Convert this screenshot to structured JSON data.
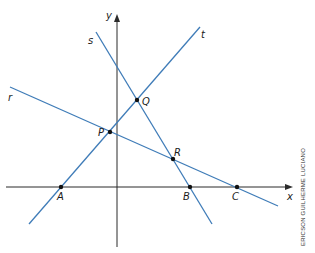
{
  "diagram": {
    "type": "cartesian-lines",
    "axes": {
      "x_label": "x",
      "y_label": "y"
    },
    "lines": [
      {
        "name": "r",
        "label": "r"
      },
      {
        "name": "s",
        "label": "s"
      },
      {
        "name": "t",
        "label": "t"
      }
    ],
    "points": [
      {
        "name": "A",
        "label": "A"
      },
      {
        "name": "B",
        "label": "B"
      },
      {
        "name": "C",
        "label": "C"
      },
      {
        "name": "P",
        "label": "P"
      },
      {
        "name": "Q",
        "label": "Q"
      },
      {
        "name": "R",
        "label": "R"
      }
    ],
    "colors": {
      "line": "#3f7cb8",
      "axis": "#2b2b2b",
      "point": "#111111"
    },
    "credit": "ERICSON GUILHERME LUCIANO"
  }
}
